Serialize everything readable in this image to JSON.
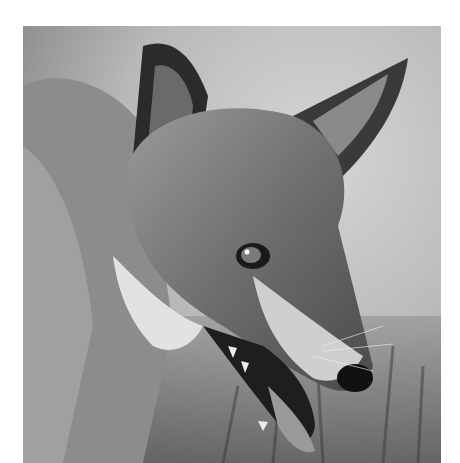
{
  "image": {
    "subject": "red fox head close-up, black and white",
    "alt": "Black and white photograph of a fox's head with open mouth, looking right"
  }
}
